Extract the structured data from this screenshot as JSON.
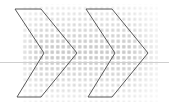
{
  "canvas": {
    "width": 169,
    "height": 106,
    "background_color": "#ffffff"
  },
  "graphic": {
    "title": "Double chevron arrow graphic",
    "description": "Two outlined right-pointing chevron arrows filled with a light grey dotted halftone grid, crossed by a thin horizontal grey rule.",
    "stroke_color": "#5a5a5a",
    "stroke_width": 1,
    "dot_color": "#d9d9d9",
    "dot_color_dense": "#c4c4c4",
    "rule_color": "#cfcfcf"
  },
  "horizontal_rule": {
    "label": "horizontal baseline rule",
    "y": 62,
    "x_start": 0,
    "x_end": 169,
    "color": "#cfcfcf",
    "thickness": 1
  },
  "dot_pattern": {
    "label": "halftone dot grid",
    "cell_size": 5.5,
    "dot_size": 2.6,
    "color": "#d9d9d9",
    "region": {
      "x": 22,
      "y": 4,
      "width": 136,
      "height": 98
    }
  },
  "shapes": [
    {
      "name": "chevron-arrow-1",
      "label": "Left chevron arrow",
      "points": "15,9 41,9 77,53 41,97 17,97 44,53",
      "stroke": "#5a5a5a",
      "fill": "none"
    },
    {
      "name": "chevron-arrow-2",
      "label": "Right chevron arrow",
      "points": "86,9 112,9 148,53 112,97 88,97 115,53",
      "stroke": "#5a5a5a",
      "fill": "none"
    }
  ]
}
